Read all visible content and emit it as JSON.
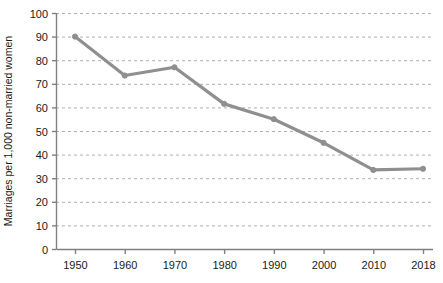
{
  "chart_data": {
    "type": "line",
    "title": "",
    "xlabel": "",
    "ylabel": "Marriages per 1,000 non-married women",
    "categories": [
      "1950",
      "1960",
      "1970",
      "1980",
      "1990",
      "2000",
      "2010",
      "2018"
    ],
    "values": [
      90,
      73.5,
      77,
      61.5,
      55,
      45,
      33.5,
      34
    ],
    "series": [
      {
        "name": "Marriages per 1,000 non-married women",
        "values": [
          90,
          73.5,
          77,
          61.5,
          55,
          45,
          33.5,
          34
        ]
      }
    ],
    "ylim": [
      0,
      100
    ],
    "ytick_labels": [
      "0",
      "10",
      "20",
      "30",
      "40",
      "50",
      "60",
      "70",
      "80",
      "90",
      "100"
    ],
    "ytick_values": [
      0,
      10,
      20,
      30,
      40,
      50,
      60,
      70,
      80,
      90,
      100
    ],
    "xtick_labels": [
      "1950",
      "1960",
      "1970",
      "1980",
      "1990",
      "2000",
      "2010",
      "2018"
    ],
    "grid": "horizontal-dashed",
    "legend": "none",
    "line_color": "#8f8f8f",
    "marker": "circle",
    "axis_color": "#808080",
    "grid_color": "#b0b0b0",
    "text_color": "#1a1a1a",
    "background": "#ffffff"
  }
}
